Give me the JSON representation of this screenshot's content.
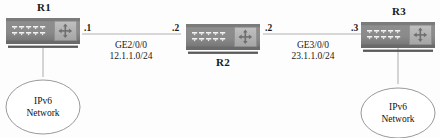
{
  "diagram": {
    "type": "network-topology",
    "colors": {
      "router_body": "#8a8a8a",
      "router_body_dark": "#6e6e6e",
      "router_panel": "#b4b4b4",
      "router_base": "#555555",
      "link_line": "#b0b0b0",
      "cloud_stroke": "#8d8d8d",
      "text": "#1a1a1a",
      "background": "#ffffff"
    },
    "nodes": [
      {
        "id": "r1",
        "label": "R1",
        "label_position": "above"
      },
      {
        "id": "r2",
        "label": "R2",
        "label_position": "below"
      },
      {
        "id": "r3",
        "label": "R3",
        "label_position": "above"
      }
    ],
    "clouds": [
      {
        "id": "cloud-left",
        "line1": "IPv6",
        "line2": "Network",
        "attached_to": "R1"
      },
      {
        "id": "cloud-right",
        "line1": "IPv6",
        "line2": "Network",
        "attached_to": "R3"
      }
    ],
    "links": [
      {
        "id": "link-r1-r2",
        "from": "R1",
        "to": "R2",
        "interface": "GE2/0/0",
        "subnet": "12.1.1.0/24",
        "from_host": ".1",
        "to_host": ".2"
      },
      {
        "id": "link-r2-r3",
        "from": "R2",
        "to": "R3",
        "interface": "GE3/0/0",
        "subnet": "23.1.1.0/24",
        "from_host": ".2",
        "to_host": ".3"
      }
    ],
    "icons": {
      "router": "router-icon",
      "cloud": "network-cloud-icon",
      "arrows": "four-way-arrow-icon",
      "ports": "port-array-icon"
    }
  }
}
